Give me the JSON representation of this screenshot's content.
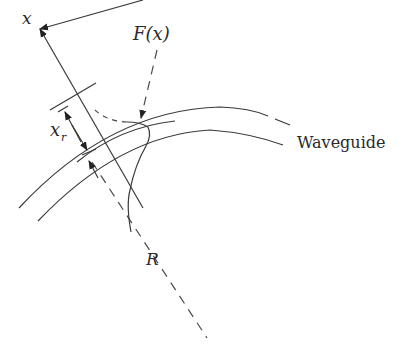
{
  "labels": {
    "x_axis": "x",
    "field": "F(x)",
    "xr_main": "x",
    "xr_sub": "r",
    "waveguide": "Waveguide",
    "radius": "R"
  },
  "colors": {
    "line": "#3a3a3a",
    "text": "#2a2a2a",
    "background": "#ffffff"
  }
}
